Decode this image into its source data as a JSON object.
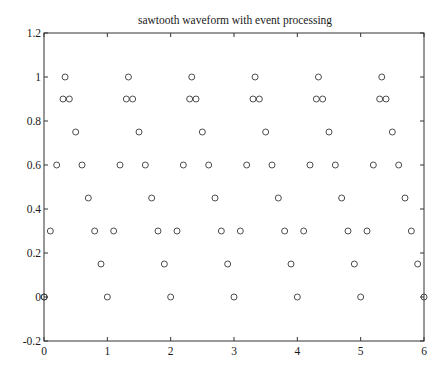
{
  "chart_data": {
    "type": "scatter",
    "title": "sawtooth waveform with event processing",
    "xlabel": "",
    "ylabel": "",
    "xlim": [
      0,
      6
    ],
    "ylim": [
      -0.2,
      1.2
    ],
    "grid": false,
    "legend": null,
    "marker": "open-circle",
    "x_ticks": [
      0,
      1,
      2,
      3,
      4,
      5,
      6
    ],
    "x_tick_labels": [
      "0",
      "1",
      "2",
      "3",
      "4",
      "5",
      "6"
    ],
    "y_ticks": [
      -0.2,
      0,
      0.2,
      0.4,
      0.6,
      0.8,
      1,
      1.2
    ],
    "y_tick_labels": [
      "-0.2",
      "0",
      "0.2",
      "0.4",
      "0.6",
      "0.8",
      "1",
      "1.2"
    ],
    "series": [
      {
        "name": "sawtooth",
        "x": [
          0,
          0.005,
          0.1,
          0.2,
          0.3,
          0.333,
          0.4,
          0.5,
          0.6,
          0.7,
          0.8,
          0.9,
          1.0,
          1.1,
          1.2,
          1.3,
          1.333,
          1.4,
          1.5,
          1.6,
          1.7,
          1.8,
          1.9,
          2.0,
          2.1,
          2.2,
          2.3,
          2.333,
          2.4,
          2.5,
          2.6,
          2.7,
          2.8,
          2.9,
          3.0,
          3.1,
          3.2,
          3.3,
          3.333,
          3.4,
          3.5,
          3.6,
          3.7,
          3.8,
          3.9,
          4.0,
          4.1,
          4.2,
          4.3,
          4.333,
          4.4,
          4.5,
          4.6,
          4.7,
          4.8,
          4.9,
          5.0,
          5.1,
          5.2,
          5.3,
          5.333,
          5.4,
          5.5,
          5.6,
          5.7,
          5.8,
          5.9,
          6.0
        ],
        "y": [
          0,
          0,
          0.3,
          0.6,
          0.9,
          1.0,
          0.9,
          0.75,
          0.6,
          0.45,
          0.3,
          0.15,
          0,
          0.3,
          0.6,
          0.9,
          1.0,
          0.9,
          0.75,
          0.6,
          0.45,
          0.3,
          0.15,
          0,
          0.3,
          0.6,
          0.9,
          1.0,
          0.9,
          0.75,
          0.6,
          0.45,
          0.3,
          0.15,
          0,
          0.3,
          0.6,
          0.9,
          1.0,
          0.9,
          0.75,
          0.6,
          0.45,
          0.3,
          0.15,
          0,
          0.3,
          0.6,
          0.9,
          1.0,
          0.9,
          0.75,
          0.6,
          0.45,
          0.3,
          0.15,
          0,
          0.3,
          0.6,
          0.9,
          1.0,
          0.9,
          0.75,
          0.6,
          0.45,
          0.3,
          0.15,
          0
        ]
      }
    ]
  },
  "layout": {
    "plot_left": 44,
    "plot_right": 424,
    "plot_top": 33,
    "plot_bottom": 341,
    "marker_radius": 3,
    "colors": {
      "axis": "#333333",
      "marker": "#3a3a3a",
      "text": "#1a1a1a",
      "background": "#ffffff"
    }
  }
}
